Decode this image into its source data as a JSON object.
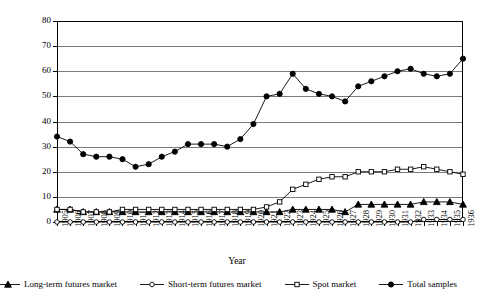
{
  "chart_data": {
    "type": "line",
    "title": "",
    "xlabel": "Year",
    "ylabel": "",
    "ylim": [
      0,
      80
    ],
    "ytick_step": 10,
    "grid": true,
    "legend_position": "bottom",
    "categories": [
      "1905",
      "1906",
      "1907",
      "1908",
      "1909",
      "1910",
      "1911",
      "1912",
      "1913",
      "1914",
      "1915",
      "1916",
      "1917",
      "1918",
      "1919",
      "1920",
      "1921",
      "1922",
      "1923",
      "1924",
      "1925",
      "1926",
      "1927",
      "1928",
      "1929",
      "1930",
      "1931",
      "1932",
      "1933",
      "1934",
      "1935",
      "1936"
    ],
    "yticks": [
      "0",
      "10",
      "20",
      "30",
      "40",
      "50",
      "60",
      "70",
      "80"
    ],
    "series": [
      {
        "name": "Long-term futures market",
        "marker": "triangle",
        "filled": true,
        "color": "#000000",
        "values": [
          5,
          5,
          4,
          4,
          4,
          4,
          4,
          4,
          4,
          4,
          4,
          4,
          4,
          4,
          4,
          4,
          4,
          4,
          5,
          5,
          5,
          5,
          4,
          7,
          7,
          7,
          7,
          7,
          8,
          8,
          8,
          7
        ]
      },
      {
        "name": "Short-term futures market",
        "marker": "circle",
        "filled": false,
        "color": "#000000",
        "values": [
          0,
          0,
          0,
          0,
          0,
          0,
          0,
          0,
          0,
          0,
          0,
          0,
          0,
          0,
          0,
          0,
          0,
          0,
          0,
          0,
          0,
          0,
          0,
          0,
          0,
          0,
          0,
          0,
          1,
          1,
          1,
          1
        ]
      },
      {
        "name": "Spot market",
        "marker": "square",
        "filled": false,
        "color": "#000000",
        "values": [
          5,
          5,
          4,
          4,
          4,
          5,
          5,
          5,
          5,
          5,
          5,
          5,
          5,
          5,
          5,
          5,
          6,
          8,
          13,
          15,
          17,
          18,
          18,
          20,
          20,
          20,
          21,
          21,
          22,
          21,
          20,
          19
        ]
      },
      {
        "name": "Total samples",
        "marker": "circle",
        "filled": true,
        "color": "#000000",
        "values": [
          34,
          32,
          27,
          26,
          26,
          25,
          22,
          23,
          26,
          28,
          31,
          31,
          31,
          30,
          33,
          39,
          50,
          51,
          59,
          53,
          51,
          50,
          48,
          54,
          56,
          58,
          60,
          61,
          59,
          58,
          59,
          65
        ]
      }
    ]
  },
  "axis": {
    "x_title": "Year"
  },
  "legend": {
    "items": [
      {
        "label": "Long-term futures market",
        "marker": "triangle-filled"
      },
      {
        "label": "Short-term futures market",
        "marker": "circle-open"
      },
      {
        "label": "Spot market",
        "marker": "square-open"
      },
      {
        "label": "Total samples",
        "marker": "circle-filled"
      }
    ]
  }
}
